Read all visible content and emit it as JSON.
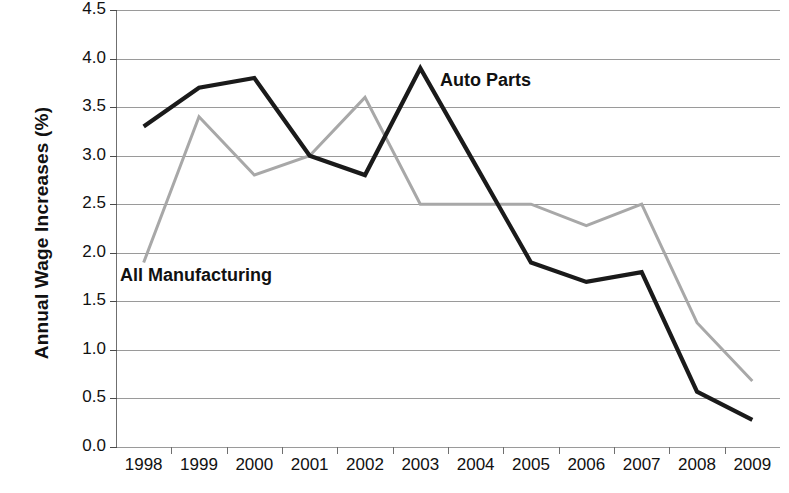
{
  "chart_data": {
    "type": "line",
    "title": "",
    "xlabel": "",
    "ylabel": "Annual Wage Increases (%)",
    "x": [
      "1998",
      "1999",
      "2000",
      "2001",
      "2002",
      "2003",
      "2004",
      "2005",
      "2006",
      "2007",
      "2008",
      "2009"
    ],
    "categories": [
      "1998",
      "1999",
      "2000",
      "2001",
      "2002",
      "2003",
      "2004",
      "2005",
      "2006",
      "2007",
      "2008",
      "2009"
    ],
    "ylim": [
      0.0,
      4.5
    ],
    "y_ticks": [
      "0.0",
      "0.5",
      "1.0",
      "1.5",
      "2.0",
      "2.5",
      "3.0",
      "3.5",
      "4.0",
      "4.5"
    ],
    "y_tick_values": [
      0.0,
      0.5,
      1.0,
      1.5,
      2.0,
      2.5,
      3.0,
      3.5,
      4.0,
      4.5
    ],
    "grid": true,
    "legend": "inline-annotations",
    "series": [
      {
        "name": "Auto Parts",
        "color": "#1a1a1a",
        "values": [
          3.3,
          3.7,
          3.8,
          3.0,
          2.8,
          3.9,
          2.9,
          1.9,
          1.7,
          1.8,
          0.57,
          0.28
        ]
      },
      {
        "name": "All Manufacturing",
        "color": "#a8a8a8",
        "values": [
          1.9,
          3.4,
          2.8,
          3.0,
          3.6,
          2.5,
          2.5,
          2.5,
          2.28,
          2.5,
          1.28,
          0.68
        ]
      }
    ],
    "annotations": [
      {
        "text": "Auto Parts",
        "series": "Auto Parts"
      },
      {
        "text": "All Manufacturing",
        "series": "All Manufacturing"
      }
    ]
  },
  "axis": {
    "y_title": "Annual Wage Increases (%)"
  }
}
